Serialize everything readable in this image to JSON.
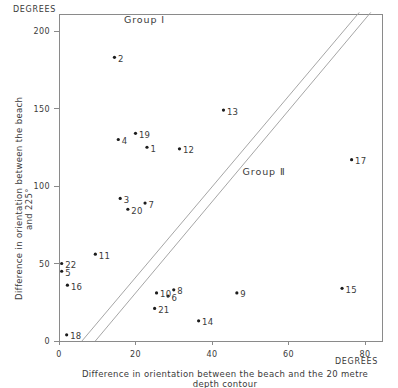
{
  "chart_data": {
    "type": "scatter",
    "title": "",
    "xlabel": "Difference in orientation between the beach and the 20 metre depth contour",
    "ylabel": "Difference in orientation between the beach and 225°",
    "x_unit_label": "DEGREES",
    "y_unit_label": "DEGREES",
    "xlim": [
      0,
      87
    ],
    "ylim": [
      0,
      215
    ],
    "xticks": [
      0,
      20,
      40,
      60,
      80
    ],
    "xticklabels": [
      "0",
      "20",
      "40",
      "60",
      "80"
    ],
    "yticks": [
      0,
      50,
      100,
      150,
      200
    ],
    "yticklabels": [
      "0",
      "50",
      "100",
      "150",
      "200"
    ],
    "grid": false,
    "legend": "none",
    "annotations": [
      {
        "text": "Group I",
        "x": 17,
        "y": 205
      },
      {
        "text": "Group Ⅱ",
        "x": 48,
        "y": 107
      }
    ],
    "bands": [
      {
        "name": "separating-band",
        "lower_line": {
          "x0": 6.0,
          "y0": 0,
          "x1": 78.5,
          "y1": 212
        },
        "upper_line": {
          "x0": 9.5,
          "y0": 0,
          "x1": 81.5,
          "y1": 212
        }
      }
    ],
    "points": [
      {
        "label": "2",
        "x": 14.5,
        "y": 183
      },
      {
        "label": "13",
        "x": 43.0,
        "y": 149
      },
      {
        "label": "19",
        "x": 20.0,
        "y": 134
      },
      {
        "label": "4",
        "x": 15.5,
        "y": 130
      },
      {
        "label": "1",
        "x": 23.0,
        "y": 125
      },
      {
        "label": "12",
        "x": 31.5,
        "y": 124
      },
      {
        "label": "17",
        "x": 76.5,
        "y": 117
      },
      {
        "label": "3",
        "x": 16.0,
        "y": 92
      },
      {
        "label": "7",
        "x": 22.5,
        "y": 89
      },
      {
        "label": "20",
        "x": 18.0,
        "y": 85
      },
      {
        "label": "11",
        "x": 9.5,
        "y": 56
      },
      {
        "label": "22",
        "x": 0.7,
        "y": 50
      },
      {
        "label": "5",
        "x": 0.7,
        "y": 45
      },
      {
        "label": "16",
        "x": 2.2,
        "y": 36
      },
      {
        "label": "15",
        "x": 74.0,
        "y": 34
      },
      {
        "label": "8",
        "x": 30.0,
        "y": 33
      },
      {
        "label": "10",
        "x": 25.5,
        "y": 31
      },
      {
        "label": "9",
        "x": 46.5,
        "y": 31
      },
      {
        "label": "6",
        "x": 28.5,
        "y": 29
      },
      {
        "label": "21",
        "x": 25.0,
        "y": 21
      },
      {
        "label": "14",
        "x": 36.5,
        "y": 13
      },
      {
        "label": "18",
        "x": 2.0,
        "y": 4
      }
    ]
  },
  "style": {
    "axis_color": "#8a8a8a",
    "band_color": "#a6a6a6",
    "point_color": "#1c1c1c",
    "text_color": "#3a3a3a",
    "background": "#ffffff"
  }
}
